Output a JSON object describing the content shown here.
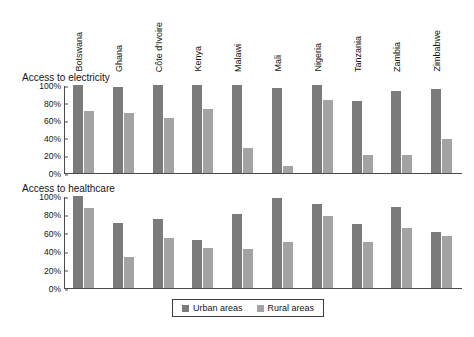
{
  "chart_data": {
    "type": "bar",
    "title": "",
    "categories": [
      "Botswana",
      "Ghana",
      "Côte d'Ivoire",
      "Kenya",
      "Malawi",
      "Mali",
      "Nigeria",
      "Tanzania",
      "Zambia",
      "Zimbabwe"
    ],
    "panels": [
      {
        "title": "Access to electricity",
        "ylabel": "",
        "xlabel": "",
        "ylim": [
          0,
          100
        ],
        "yticks": [
          "0%",
          "20%",
          "40%",
          "60%",
          "80%",
          "100%"
        ],
        "ytick_values": [
          0,
          20,
          40,
          60,
          80,
          100
        ],
        "grid": false,
        "series": [
          {
            "name": "Urban areas",
            "values": [
              100,
              98,
              100,
              100,
              100,
              97,
              100,
              82,
              93,
              95
            ]
          },
          {
            "name": "Rural areas",
            "values": [
              71,
              68,
              62,
              73,
              28,
              8,
              83,
              21,
              21,
              39
            ]
          }
        ]
      },
      {
        "title": "Access to healthcare",
        "ylabel": "",
        "xlabel": "",
        "ylim": [
          0,
          100
        ],
        "yticks": [
          "0%",
          "20%",
          "40%",
          "60%",
          "80%",
          "100%"
        ],
        "ytick_values": [
          0,
          20,
          40,
          60,
          80,
          100
        ],
        "grid": false,
        "series": [
          {
            "name": "Urban areas",
            "values": [
              100,
              71,
              75,
              52,
              80,
              98,
              91,
              70,
              88,
              61
            ]
          },
          {
            "name": "Rural areas",
            "values": [
              87,
              34,
              54,
              44,
              42,
              50,
              78,
              50,
              65,
              57
            ]
          }
        ]
      }
    ],
    "legend": {
      "position": "bottom-center",
      "entries": [
        {
          "label": "Urban areas",
          "color": "#7b7b7b"
        },
        {
          "label": "Rural areas",
          "color": "#a3a3a3"
        }
      ]
    },
    "colors": {
      "urban": "#7b7b7b",
      "rural": "#a3a3a3",
      "axis": "#4a4a4a",
      "text": "#141414",
      "background": "#ffffff"
    }
  }
}
